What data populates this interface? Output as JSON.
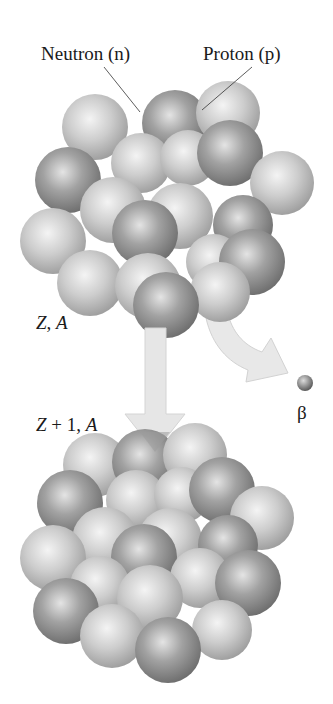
{
  "labels": {
    "neutron": "Neutron (n)",
    "proton": "Proton (p)",
    "parent_Z": "Z",
    "parent_sep": ", ",
    "parent_A": "A",
    "daughter_Z": "Z",
    "daughter_plus": " + 1, ",
    "daughter_A": "A",
    "beta": "β"
  },
  "colors": {
    "neutron": "#8f8f8f",
    "proton": "#c4c4c4",
    "arrow": "#e6e6e6",
    "arrow_edge": "#d0d0d0",
    "beta": "#7a7a7a"
  },
  "parent_nucleus": {
    "nucleons": [
      {
        "x": 95,
        "y": 127,
        "r": 33,
        "type": "p"
      },
      {
        "x": 175,
        "y": 123,
        "r": 33,
        "type": "n"
      },
      {
        "x": 228,
        "y": 113,
        "r": 32,
        "type": "p"
      },
      {
        "x": 68,
        "y": 180,
        "r": 33,
        "type": "n"
      },
      {
        "x": 141,
        "y": 163,
        "r": 30,
        "type": "p"
      },
      {
        "x": 188,
        "y": 158,
        "r": 28,
        "type": "p"
      },
      {
        "x": 230,
        "y": 153,
        "r": 33,
        "type": "n"
      },
      {
        "x": 282,
        "y": 183,
        "r": 32,
        "type": "p"
      },
      {
        "x": 113,
        "y": 210,
        "r": 33,
        "type": "p"
      },
      {
        "x": 180,
        "y": 216,
        "r": 33,
        "type": "p"
      },
      {
        "x": 243,
        "y": 225,
        "r": 30,
        "type": "n"
      },
      {
        "x": 53,
        "y": 241,
        "r": 33,
        "type": "p"
      },
      {
        "x": 145,
        "y": 233,
        "r": 33,
        "type": "n"
      },
      {
        "x": 90,
        "y": 283,
        "r": 33,
        "type": "p"
      },
      {
        "x": 214,
        "y": 262,
        "r": 28,
        "type": "p"
      },
      {
        "x": 252,
        "y": 262,
        "r": 33,
        "type": "n"
      },
      {
        "x": 148,
        "y": 286,
        "r": 33,
        "type": "p"
      },
      {
        "x": 220,
        "y": 292,
        "r": 30,
        "type": "p"
      },
      {
        "x": 166,
        "y": 305,
        "r": 33,
        "type": "n"
      }
    ]
  },
  "daughter_nucleus": {
    "nucleons": [
      {
        "x": 95,
        "y": 465,
        "r": 32,
        "type": "p"
      },
      {
        "x": 145,
        "y": 462,
        "r": 33,
        "type": "n"
      },
      {
        "x": 195,
        "y": 455,
        "r": 32,
        "type": "p"
      },
      {
        "x": 70,
        "y": 503,
        "r": 33,
        "type": "n"
      },
      {
        "x": 136,
        "y": 500,
        "r": 30,
        "type": "p"
      },
      {
        "x": 182,
        "y": 495,
        "r": 28,
        "type": "p"
      },
      {
        "x": 222,
        "y": 490,
        "r": 33,
        "type": "n"
      },
      {
        "x": 262,
        "y": 518,
        "r": 32,
        "type": "p"
      },
      {
        "x": 105,
        "y": 540,
        "r": 33,
        "type": "p"
      },
      {
        "x": 170,
        "y": 540,
        "r": 32,
        "type": "p"
      },
      {
        "x": 228,
        "y": 545,
        "r": 30,
        "type": "n"
      },
      {
        "x": 53,
        "y": 558,
        "r": 33,
        "type": "p"
      },
      {
        "x": 144,
        "y": 557,
        "r": 33,
        "type": "n"
      },
      {
        "x": 100,
        "y": 586,
        "r": 30,
        "type": "p"
      },
      {
        "x": 200,
        "y": 578,
        "r": 30,
        "type": "p"
      },
      {
        "x": 248,
        "y": 583,
        "r": 33,
        "type": "n"
      },
      {
        "x": 66,
        "y": 611,
        "r": 33,
        "type": "n"
      },
      {
        "x": 150,
        "y": 598,
        "r": 33,
        "type": "p"
      },
      {
        "x": 112,
        "y": 636,
        "r": 32,
        "type": "p"
      },
      {
        "x": 222,
        "y": 630,
        "r": 30,
        "type": "p"
      },
      {
        "x": 168,
        "y": 650,
        "r": 33,
        "type": "n"
      }
    ]
  }
}
